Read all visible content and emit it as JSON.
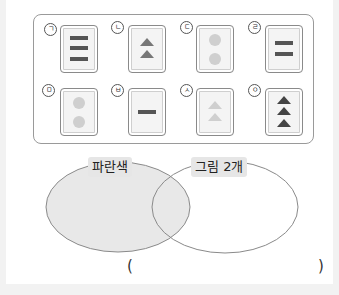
{
  "problem": {
    "cards": [
      {
        "mark": "ㄱ",
        "shape": "bars",
        "count": 3,
        "color": "#555555"
      },
      {
        "mark": "ㄴ",
        "shape": "triangles",
        "count": 2,
        "color": "#777777"
      },
      {
        "mark": "ㄷ",
        "shape": "circles",
        "count": 2,
        "color": "#cfcfcf"
      },
      {
        "mark": "ㄹ",
        "shape": "bars",
        "count": 2,
        "color": "#555555"
      },
      {
        "mark": "ㅁ",
        "shape": "circles",
        "count": 2,
        "color": "#cfcfcf"
      },
      {
        "mark": "ㅂ",
        "shape": "bars",
        "count": 1,
        "color": "#555555"
      },
      {
        "mark": "ㅅ",
        "shape": "triangles",
        "count": 2,
        "color": "#cfcfcf"
      },
      {
        "mark": "ㅇ",
        "shape": "triangles",
        "count": 3,
        "color": "#444444"
      }
    ],
    "venn": {
      "left_label": "파란색",
      "right_label": "그림 2개",
      "left_fill": "#e8e8e8"
    },
    "answer": {
      "open": "(",
      "close": ")",
      "value": ""
    }
  }
}
